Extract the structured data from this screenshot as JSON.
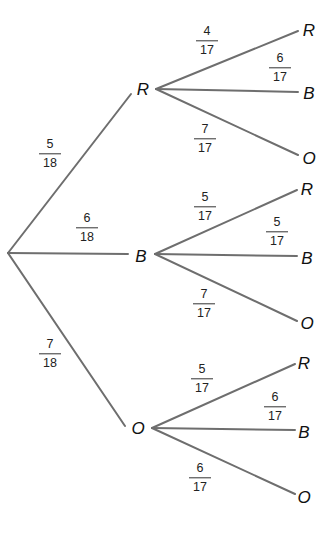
{
  "diagram": {
    "type": "probability-tree",
    "line_color": "#6e6e6e",
    "text_color": "#111111",
    "root": {
      "x": 8,
      "y": 253
    },
    "first_level": [
      {
        "outcome": "R",
        "label_pos": {
          "x": 143,
          "y": 89
        },
        "branch": {
          "x1": 8,
          "y1": 253,
          "x2": 131,
          "y2": 94
        },
        "prob": {
          "num": "5",
          "den": "18",
          "x": 50,
          "y": 154
        },
        "children": [
          {
            "outcome": "R",
            "branch": {
              "x1": 156,
              "y1": 89,
              "x2": 298,
              "y2": 31
            },
            "leaf_pos": {
              "x": 309,
              "y": 30
            },
            "prob": {
              "num": "4",
              "den": "17",
              "x": 207,
              "y": 41
            }
          },
          {
            "outcome": "B",
            "branch": {
              "x1": 156,
              "y1": 89,
              "x2": 298,
              "y2": 92
            },
            "leaf_pos": {
              "x": 309,
              "y": 93
            },
            "prob": {
              "num": "6",
              "den": "17",
              "x": 280,
              "y": 68
            }
          },
          {
            "outcome": "O",
            "branch": {
              "x1": 156,
              "y1": 89,
              "x2": 298,
              "y2": 155
            },
            "leaf_pos": {
              "x": 309,
              "y": 158
            },
            "prob": {
              "num": "7",
              "den": "17",
              "x": 205,
              "y": 139
            }
          }
        ]
      },
      {
        "outcome": "B",
        "label_pos": {
          "x": 141,
          "y": 256
        },
        "branch": {
          "x1": 8,
          "y1": 253,
          "x2": 128,
          "y2": 254
        },
        "prob": {
          "num": "6",
          "den": "18",
          "x": 87,
          "y": 228
        },
        "children": [
          {
            "outcome": "R",
            "branch": {
              "x1": 155,
              "y1": 254,
              "x2": 297,
              "y2": 190
            },
            "leaf_pos": {
              "x": 307,
              "y": 189
            },
            "prob": {
              "num": "5",
              "den": "17",
              "x": 205,
              "y": 207
            }
          },
          {
            "outcome": "B",
            "branch": {
              "x1": 155,
              "y1": 254,
              "x2": 297,
              "y2": 256
            },
            "leaf_pos": {
              "x": 307,
              "y": 258
            },
            "prob": {
              "num": "5",
              "den": "17",
              "x": 277,
              "y": 232
            }
          },
          {
            "outcome": "O",
            "branch": {
              "x1": 155,
              "y1": 254,
              "x2": 297,
              "y2": 321
            },
            "leaf_pos": {
              "x": 307,
              "y": 323
            },
            "prob": {
              "num": "7",
              "den": "17",
              "x": 204,
              "y": 304
            }
          }
        ]
      },
      {
        "outcome": "O",
        "label_pos": {
          "x": 138,
          "y": 428
        },
        "branch": {
          "x1": 8,
          "y1": 253,
          "x2": 125,
          "y2": 426
        },
        "prob": {
          "num": "7",
          "den": "18",
          "x": 50,
          "y": 354
        },
        "children": [
          {
            "outcome": "R",
            "branch": {
              "x1": 152,
              "y1": 428,
              "x2": 295,
              "y2": 364
            },
            "leaf_pos": {
              "x": 304,
              "y": 363
            },
            "prob": {
              "num": "5",
              "den": "17",
              "x": 202,
              "y": 379
            }
          },
          {
            "outcome": "B",
            "branch": {
              "x1": 152,
              "y1": 428,
              "x2": 295,
              "y2": 430
            },
            "leaf_pos": {
              "x": 304,
              "y": 432
            },
            "prob": {
              "num": "6",
              "den": "17",
              "x": 275,
              "y": 407
            }
          },
          {
            "outcome": "O",
            "branch": {
              "x1": 152,
              "y1": 428,
              "x2": 295,
              "y2": 494
            },
            "leaf_pos": {
              "x": 304,
              "y": 497
            },
            "prob": {
              "num": "6",
              "den": "17",
              "x": 200,
              "y": 478
            }
          }
        ]
      }
    ]
  }
}
